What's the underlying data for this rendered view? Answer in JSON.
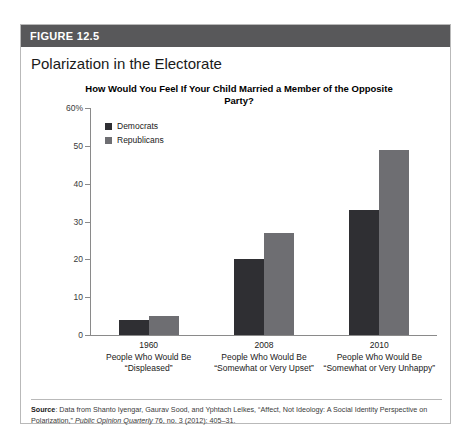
{
  "figure": {
    "header_label": "FIGURE 12.5",
    "title": "Polarization in the Electorate"
  },
  "source": {
    "label": "Source",
    "text_part1": ": Data from Shanto Iyengar, Gaurav Sood, and Yphtach Lelkes, “Affect, Not Ideology: A Social Identity Perspective on Polarization,” ",
    "italic": "Public Opinion Quarterly",
    "text_part2": " 76, no. 3 (2012): 405–31."
  },
  "colors": {
    "header_bar": "#58585a",
    "democrats": "#2f2f33",
    "republicans": "#6e6e72",
    "axis": "#8a8a8a",
    "card_border": "#b9b9b9"
  },
  "chart_data": {
    "type": "bar",
    "title": "How Would You Feel If Your Child Married a Member of the Opposite Party?",
    "xlabel": "",
    "ylabel": "",
    "ylim": [
      0,
      60
    ],
    "yticks": [
      "0",
      "10",
      "20",
      "30",
      "40",
      "50",
      "60%"
    ],
    "grid": false,
    "legend_position": "top-left",
    "categories": [
      "1960",
      "2008",
      "2010"
    ],
    "category_sublabels": [
      "People Who Would Be “Displeased”",
      "People Who Would Be “Somewhat or Very Upset”",
      "People Who Would Be “Somewhat or Very Unhappy”"
    ],
    "category_sublabel_lines": [
      [
        "People Who Would Be",
        "“Displeased”"
      ],
      [
        "People Who Would Be",
        "“Somewhat or Very Upset”"
      ],
      [
        "People Who Would Be",
        "“Somewhat or Very Unhappy”"
      ]
    ],
    "series": [
      {
        "name": "Democrats",
        "values": [
          4,
          20,
          33
        ]
      },
      {
        "name": "Republicans",
        "values": [
          5,
          27,
          49
        ]
      }
    ]
  }
}
